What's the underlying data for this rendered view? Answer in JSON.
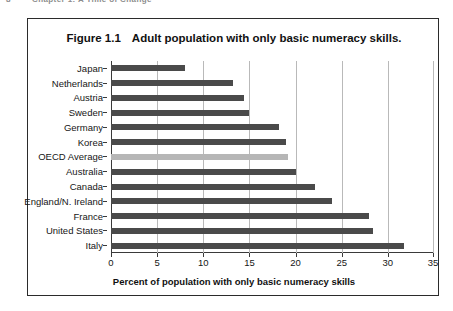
{
  "page_header": {
    "page_number": "8",
    "running_title": "Chapter 1: A Time of Change"
  },
  "figure": {
    "number": "Figure 1.1",
    "title": "Adult population with only basic numeracy skills."
  },
  "chart_data": {
    "type": "bar",
    "orientation": "horizontal",
    "title": "Adult population with only basic numeracy skills.",
    "xlabel": "Percent of population with only basic numeracy skills",
    "ylabel": "",
    "xlim": [
      0,
      35
    ],
    "xticks": [
      0,
      5,
      10,
      15,
      20,
      25,
      30,
      35
    ],
    "grid": "vertical",
    "legend": "none",
    "highlight_category": "OECD Average",
    "colors": {
      "bar": "#4a4a4a",
      "highlight_bar": "#b6b6b6",
      "gridline": "#b9b9b9",
      "axis": "#3a3a3a",
      "frame": "#2b2b2b"
    },
    "categories": [
      "Japan",
      "Netherlands",
      "Austria",
      "Sweden",
      "Germany",
      "Korea",
      "OECD Average",
      "Australia",
      "Canada",
      "England/N. Ireland",
      "France",
      "United States",
      "Italy"
    ],
    "values": [
      8.0,
      13.2,
      14.4,
      15.0,
      18.2,
      19.0,
      19.2,
      20.0,
      22.1,
      24.0,
      28.0,
      28.4,
      31.7
    ]
  }
}
